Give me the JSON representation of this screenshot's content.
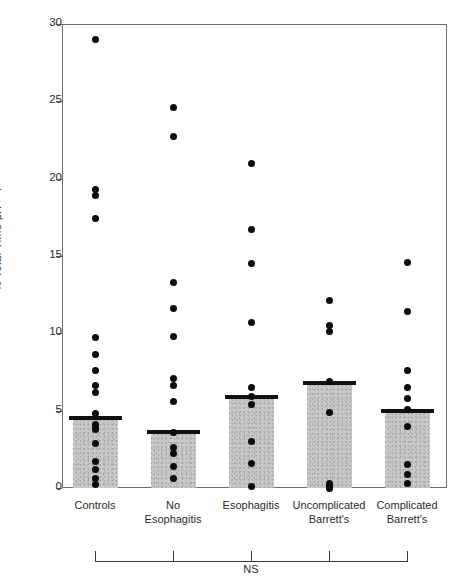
{
  "chart_data": {
    "type": "scatter",
    "title": "",
    "xlabel": "",
    "ylabel": "% Total Time pH > 7",
    "ylim": [
      0,
      30
    ],
    "ytick_labels": [
      "0",
      "5",
      "10",
      "15",
      "20",
      "25",
      "30"
    ],
    "yticks": [
      0,
      5,
      10,
      15,
      20,
      25,
      30
    ],
    "grid": false,
    "legend": null,
    "categories": [
      "Controls",
      "No Esophagitis",
      "Esophagitis",
      "Uncomplicated Barrett's",
      "Complicated Barrett's"
    ],
    "category_lines": [
      [
        "Controls"
      ],
      [
        "No",
        "Esophagitis"
      ],
      [
        "Esophagitis"
      ],
      [
        "Uncomplicated",
        "Barrett's"
      ],
      [
        "Complicated",
        "Barrett's"
      ]
    ],
    "bar_label": "median",
    "values": [
      4.5,
      3.6,
      5.9,
      6.8,
      5.0
    ],
    "series": [
      {
        "name": "Controls",
        "points": [
          29.0,
          19.3,
          18.9,
          17.4,
          9.7,
          8.6,
          7.6,
          6.6,
          6.2,
          4.8,
          4.1,
          3.8,
          2.9,
          1.7,
          1.2,
          0.6,
          0.2
        ]
      },
      {
        "name": "No Esophagitis",
        "points": [
          24.6,
          22.7,
          13.3,
          11.6,
          9.8,
          7.1,
          6.6,
          5.6,
          3.6,
          2.6,
          2.2,
          1.4,
          0.6
        ]
      },
      {
        "name": "Esophagitis",
        "points": [
          21.0,
          16.7,
          14.5,
          10.7,
          6.5,
          5.9,
          5.4,
          3.0,
          1.6,
          0.1
        ]
      },
      {
        "name": "Uncomplicated Barrett's",
        "points": [
          12.1,
          10.5,
          10.1,
          6.9,
          4.9,
          0.2,
          0.0
        ]
      },
      {
        "name": "Complicated Barrett's",
        "points": [
          14.6,
          11.4,
          7.6,
          6.5,
          5.8,
          5.1,
          4.0,
          1.5,
          0.9,
          0.3
        ]
      }
    ],
    "annotations": [
      {
        "text": "NS",
        "type": "significance-bracket",
        "spans": [
          "Controls",
          "No Esophagitis",
          "Esophagitis",
          "Uncomplicated Barrett's",
          "Complicated Barrett's"
        ]
      }
    ],
    "colors": {
      "bar_fill": "#c9c9c9",
      "bar_cap": "#111111",
      "point": "#0c0c0c",
      "axis": "#6e6e6e",
      "text": "#2b2b2b"
    }
  }
}
